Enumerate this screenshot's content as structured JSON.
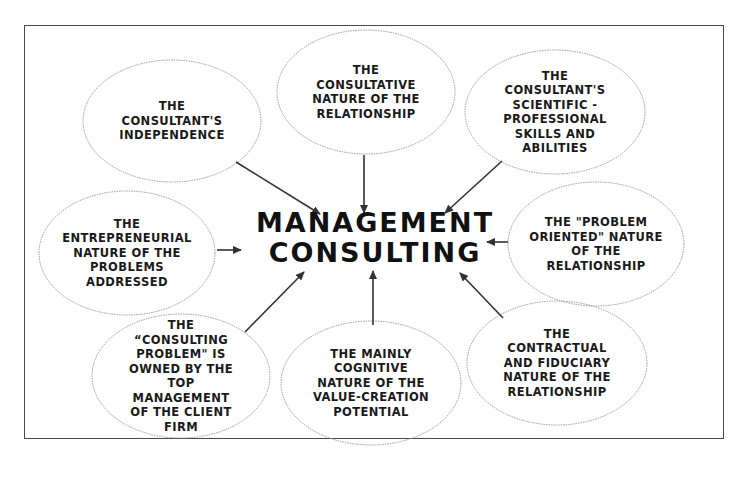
{
  "diagram": {
    "center": {
      "label": "MANAGEMENT\nCONSULTING"
    },
    "nodes": [
      {
        "id": "independence",
        "label": "THE\nCONSULTANT'S\nINDEPENDENCE"
      },
      {
        "id": "consultative",
        "label": "THE\nCONSULTATIVE\nNATURE OF THE\nRELATIONSHIP"
      },
      {
        "id": "scientific",
        "label": "THE\nCONSULTANT'S\nSCIENTIFIC -\nPROFESSIONAL\nSKILLS AND\nABILITIES"
      },
      {
        "id": "entrepreneurial",
        "label": "THE\nENTREPRENEURIAL\nNATURE OF THE\nPROBLEMS\nADDRESSED"
      },
      {
        "id": "problem-oriented",
        "label": "THE \"PROBLEM\nORIENTED\" NATURE\nOF THE\nRELATIONSHIP"
      },
      {
        "id": "consulting-problem",
        "label": "THE\n“CONSULTING\nPROBLEM\" IS\nOWNED BY THE\nTOP\nMANAGEMENT\nOF THE CLIENT\nFIRM"
      },
      {
        "id": "cognitive",
        "label": "THE MAINLY\nCOGNITIVE\nNATURE OF THE\nVALUE-CREATION\nPOTENTIAL"
      },
      {
        "id": "contractual",
        "label": "THE\nCONTRACTUAL\nAND FIDUCIARY\nNATURE OF THE\nRELATIONSHIP"
      }
    ],
    "edges": [
      {
        "from": "independence",
        "to": "center"
      },
      {
        "from": "consultative",
        "to": "center"
      },
      {
        "from": "scientific",
        "to": "center"
      },
      {
        "from": "entrepreneurial",
        "to": "center"
      },
      {
        "from": "problem-oriented",
        "to": "center"
      },
      {
        "from": "consulting-problem",
        "to": "center"
      },
      {
        "from": "cognitive",
        "to": "center"
      },
      {
        "from": "contractual",
        "to": "center"
      }
    ],
    "colors": {
      "text": "#1a1a1a",
      "ellipse_stroke": "#9a9a9a",
      "arrow": "#333333",
      "frame": "#4a4a4a"
    }
  }
}
